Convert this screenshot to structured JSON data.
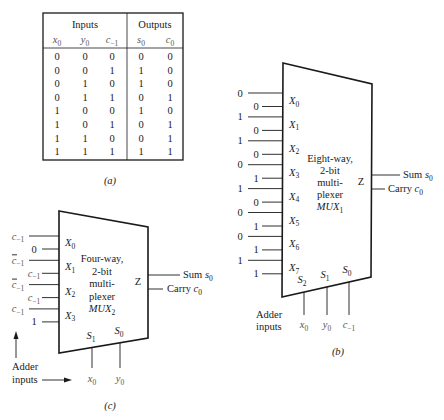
{
  "figure_a": {
    "caption": "(a)",
    "group_headers": {
      "inputs": "Inputs",
      "outputs": "Outputs"
    },
    "columns": [
      {
        "base": "x",
        "sub": "0"
      },
      {
        "base": "y",
        "sub": "0"
      },
      {
        "base": "c",
        "sub": "−1"
      },
      {
        "base": "s",
        "sub": "0"
      },
      {
        "base": "c",
        "sub": "0"
      }
    ],
    "rows": [
      [
        "0",
        "0",
        "0",
        "0",
        "0"
      ],
      [
        "0",
        "0",
        "1",
        "1",
        "0"
      ],
      [
        "0",
        "1",
        "0",
        "1",
        "0"
      ],
      [
        "0",
        "1",
        "1",
        "0",
        "1"
      ],
      [
        "1",
        "0",
        "0",
        "1",
        "0"
      ],
      [
        "1",
        "0",
        "1",
        "0",
        "1"
      ],
      [
        "1",
        "1",
        "0",
        "0",
        "1"
      ],
      [
        "1",
        "1",
        "1",
        "1",
        "1"
      ]
    ]
  },
  "figure_b": {
    "caption": "(b)",
    "title_lines": [
      "Eight-way,",
      "2-bit",
      "multi-",
      "plexer"
    ],
    "name": {
      "base": "MUX",
      "sub": "1"
    },
    "output_port": "Z",
    "outputs": [
      {
        "label": "Sum ",
        "var": "s",
        "sub": "0"
      },
      {
        "label": "Carry ",
        "var": "c",
        "sub": "0"
      }
    ],
    "data_inputs": [
      {
        "port": "X",
        "sub": "0",
        "bits": [
          "0",
          "0"
        ]
      },
      {
        "port": "X",
        "sub": "1",
        "bits": [
          "1",
          "0"
        ]
      },
      {
        "port": "X",
        "sub": "2",
        "bits": [
          "1",
          "0"
        ]
      },
      {
        "port": "X",
        "sub": "3",
        "bits": [
          "0",
          "1"
        ]
      },
      {
        "port": "X",
        "sub": "4",
        "bits": [
          "1",
          "0"
        ]
      },
      {
        "port": "X",
        "sub": "5",
        "bits": [
          "0",
          "1"
        ]
      },
      {
        "port": "X",
        "sub": "6",
        "bits": [
          "0",
          "1"
        ]
      },
      {
        "port": "X",
        "sub": "7",
        "bits": [
          "1",
          "1"
        ]
      }
    ],
    "select_inputs": [
      {
        "port": "S",
        "sub": "2",
        "var": "x",
        "var_sub": "0"
      },
      {
        "port": "S",
        "sub": "1",
        "var": "y",
        "var_sub": "0"
      },
      {
        "port": "S",
        "sub": "0",
        "var": "c",
        "var_sub": "−1"
      }
    ],
    "adder_label": [
      "Adder",
      "inputs"
    ]
  },
  "figure_c": {
    "caption": "(c)",
    "title_lines": [
      "Four-way,",
      "2-bit",
      "multi-",
      "plexer"
    ],
    "name": {
      "base": "MUX",
      "sub": "2"
    },
    "output_port": "Z",
    "outputs": [
      {
        "label": "Sum ",
        "var": "s",
        "sub": "0"
      },
      {
        "label": "Carry ",
        "var": "c",
        "sub": "0"
      }
    ],
    "data_inputs": [
      {
        "port": "X",
        "sub": "0",
        "bits": [
          {
            "text": "c",
            "sub": "−1",
            "bar": false
          },
          {
            "text": "0",
            "sub": "",
            "bar": false
          }
        ]
      },
      {
        "port": "X",
        "sub": "1",
        "bits": [
          {
            "text": "c",
            "sub": "−1",
            "bar": true
          },
          {
            "text": "c",
            "sub": "−1",
            "bar": false
          }
        ]
      },
      {
        "port": "X",
        "sub": "2",
        "bits": [
          {
            "text": "c",
            "sub": "−1",
            "bar": true
          },
          {
            "text": "c",
            "sub": "−1",
            "bar": false
          }
        ]
      },
      {
        "port": "X",
        "sub": "3",
        "bits": [
          {
            "text": "c",
            "sub": "−1",
            "bar": false
          },
          {
            "text": "1",
            "sub": "",
            "bar": false
          }
        ]
      }
    ],
    "select_inputs": [
      {
        "port": "S",
        "sub": "1",
        "var": "x",
        "var_sub": "0"
      },
      {
        "port": "S",
        "sub": "0",
        "var": "y",
        "var_sub": "0"
      }
    ],
    "adder_label": [
      "Adder",
      "inputs"
    ]
  }
}
